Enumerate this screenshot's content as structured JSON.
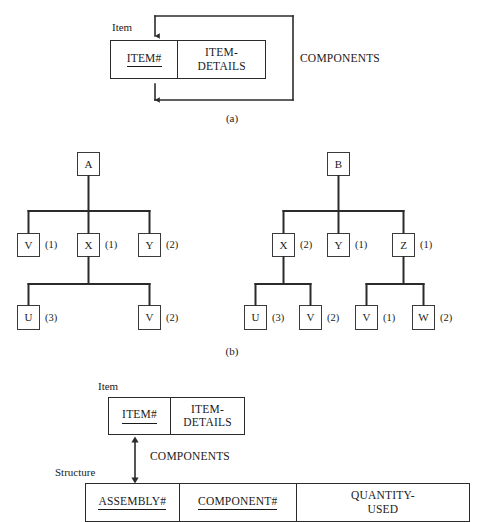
{
  "figure": {
    "line_color": "#2b2b2b",
    "text_color": "#1a1a1a",
    "background": "#ffffff"
  },
  "part_a": {
    "caption": "(a)",
    "entity_label": "Item",
    "relationship_label": "COMPONENTS",
    "attributes": [
      {
        "name": "ITEM#",
        "key": true
      },
      {
        "name": "ITEM-\nDETAILS",
        "key": false
      }
    ],
    "attribute_1": "ITEM#",
    "attribute_2_line1": "ITEM-",
    "attribute_2_line2": "DETAILS"
  },
  "part_b": {
    "caption": "(b)",
    "trees": [
      {
        "root": "A",
        "level1": [
          {
            "label": "V",
            "qty": "(1)"
          },
          {
            "label": "X",
            "qty": "(1)"
          },
          {
            "label": "Y",
            "qty": "(2)"
          }
        ],
        "level2_parent": "X",
        "level2": [
          {
            "label": "U",
            "qty": "(3)"
          },
          {
            "label": "V",
            "qty": "(2)"
          }
        ]
      },
      {
        "root": "B",
        "level1": [
          {
            "label": "X",
            "qty": "(2)"
          },
          {
            "label": "Y",
            "qty": "(1)"
          },
          {
            "label": "Z",
            "qty": "(1)"
          }
        ],
        "level2_groups": [
          {
            "parent": "X",
            "children": [
              {
                "label": "U",
                "qty": "(3)"
              },
              {
                "label": "V",
                "qty": "(2)"
              }
            ]
          },
          {
            "parent": "Z",
            "children": [
              {
                "label": "V",
                "qty": "(1)"
              },
              {
                "label": "W",
                "qty": "(2)"
              }
            ]
          }
        ]
      }
    ]
  },
  "part_c": {
    "item_entity_label": "Item",
    "structure_entity_label": "Structure",
    "relationship_label": "COMPONENTS",
    "item_attributes": [
      {
        "name": "ITEM#",
        "key": true
      },
      {
        "name": "ITEM-\nDETAILS",
        "key": false
      }
    ],
    "item_attribute_1": "ITEM#",
    "item_attribute_2_line1": "ITEM-",
    "item_attribute_2_line2": "DETAILS",
    "structure_attributes": [
      {
        "name": "ASSEMBLY#",
        "key": true
      },
      {
        "name": "COMPONENT#",
        "key": true
      },
      {
        "name": "QUANTITY-USED",
        "key": false
      }
    ],
    "structure_attribute_1": "ASSEMBLY#",
    "structure_attribute_2": "COMPONENT#",
    "structure_attribute_3_line1": "QUANTITY-",
    "structure_attribute_3_line2": "USED"
  }
}
